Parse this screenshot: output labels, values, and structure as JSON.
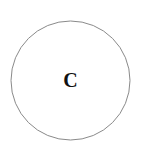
{
  "diagram": {
    "node": {
      "label": "C",
      "shape": "circle",
      "cx": 70.5,
      "cy": 80.5,
      "r": 59.5,
      "stroke": "#8a8a8a",
      "fill": "#ffffff",
      "text_color": "#111111"
    }
  }
}
